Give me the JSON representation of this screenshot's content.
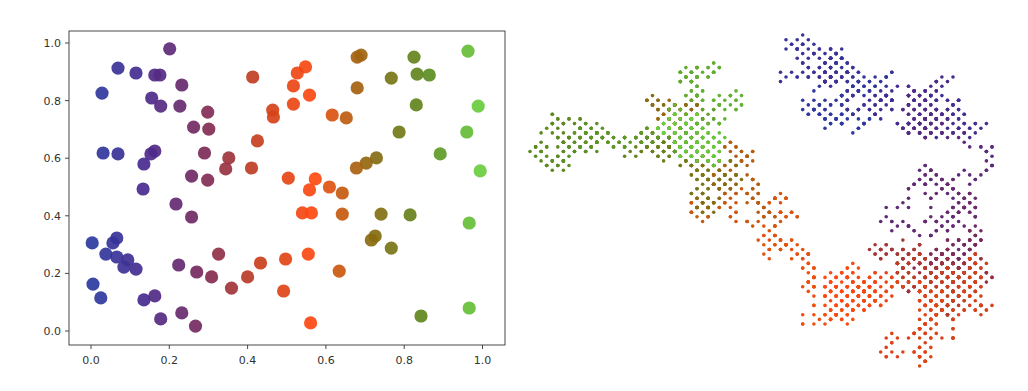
{
  "chart_data": [
    {
      "type": "scatter",
      "title": "",
      "xlabel": "",
      "ylabel": "",
      "xlim": [
        -0.05,
        1.05
      ],
      "ylim": [
        -0.05,
        1.04
      ],
      "grid": false,
      "legend": "none",
      "color_by": "x",
      "colormap": [
        "#2b3aa0",
        "#4a2a8e",
        "#7a2a5a",
        "#c7401c",
        "#ff4a10",
        "#8a6a10",
        "#5a8a20",
        "#6ad040"
      ],
      "xticks": [
        "0.0",
        "0.2",
        "0.4",
        "0.6",
        "0.8",
        "1.0"
      ],
      "yticks": [
        "0.0",
        "0.2",
        "0.4",
        "0.6",
        "0.8",
        "1.0"
      ],
      "points": [
        [
          0.201,
          0.98
        ],
        [
          0.069,
          0.913
        ],
        [
          0.115,
          0.896
        ],
        [
          0.163,
          0.889
        ],
        [
          0.176,
          0.889
        ],
        [
          0.232,
          0.854
        ],
        [
          0.028,
          0.826
        ],
        [
          0.155,
          0.809
        ],
        [
          0.178,
          0.781
        ],
        [
          0.227,
          0.781
        ],
        [
          0.298,
          0.76
        ],
        [
          0.262,
          0.708
        ],
        [
          0.301,
          0.701
        ],
        [
          0.031,
          0.618
        ],
        [
          0.069,
          0.615
        ],
        [
          0.163,
          0.625
        ],
        [
          0.153,
          0.615
        ],
        [
          0.29,
          0.618
        ],
        [
          0.135,
          0.58
        ],
        [
          0.257,
          0.538
        ],
        [
          0.298,
          0.524
        ],
        [
          0.133,
          0.493
        ],
        [
          0.217,
          0.441
        ],
        [
          0.257,
          0.396
        ],
        [
          0.003,
          0.306
        ],
        [
          0.066,
          0.323
        ],
        [
          0.056,
          0.306
        ],
        [
          0.038,
          0.267
        ],
        [
          0.066,
          0.257
        ],
        [
          0.094,
          0.247
        ],
        [
          0.084,
          0.222
        ],
        [
          0.115,
          0.215
        ],
        [
          0.224,
          0.229
        ],
        [
          0.27,
          0.205
        ],
        [
          0.308,
          0.188
        ],
        [
          0.326,
          0.267
        ],
        [
          0.005,
          0.163
        ],
        [
          0.025,
          0.115
        ],
        [
          0.135,
          0.108
        ],
        [
          0.163,
          0.122
        ],
        [
          0.178,
          0.042
        ],
        [
          0.232,
          0.063
        ],
        [
          0.267,
          0.017
        ],
        [
          0.413,
          0.882
        ],
        [
          0.548,
          0.917
        ],
        [
          0.527,
          0.896
        ],
        [
          0.517,
          0.851
        ],
        [
          0.558,
          0.819
        ],
        [
          0.517,
          0.788
        ],
        [
          0.464,
          0.767
        ],
        [
          0.466,
          0.743
        ],
        [
          0.616,
          0.75
        ],
        [
          0.652,
          0.74
        ],
        [
          0.68,
          0.951
        ],
        [
          0.68,
          0.844
        ],
        [
          0.425,
          0.66
        ],
        [
          0.352,
          0.601
        ],
        [
          0.344,
          0.563
        ],
        [
          0.41,
          0.566
        ],
        [
          0.504,
          0.531
        ],
        [
          0.573,
          0.528
        ],
        [
          0.558,
          0.49
        ],
        [
          0.609,
          0.5
        ],
        [
          0.642,
          0.479
        ],
        [
          0.54,
          0.41
        ],
        [
          0.563,
          0.41
        ],
        [
          0.642,
          0.406
        ],
        [
          0.433,
          0.236
        ],
        [
          0.497,
          0.25
        ],
        [
          0.555,
          0.267
        ],
        [
          0.4,
          0.188
        ],
        [
          0.359,
          0.149
        ],
        [
          0.492,
          0.139
        ],
        [
          0.634,
          0.208
        ],
        [
          0.561,
          0.028
        ],
        [
          0.69,
          0.958
        ],
        [
          0.825,
          0.951
        ],
        [
          0.963,
          0.972
        ],
        [
          0.767,
          0.878
        ],
        [
          0.833,
          0.892
        ],
        [
          0.864,
          0.889
        ],
        [
          0.831,
          0.785
        ],
        [
          0.989,
          0.781
        ],
        [
          0.787,
          0.691
        ],
        [
          0.96,
          0.691
        ],
        [
          0.892,
          0.615
        ],
        [
          0.994,
          0.556
        ],
        [
          0.729,
          0.601
        ],
        [
          0.703,
          0.583
        ],
        [
          0.678,
          0.566
        ],
        [
          0.741,
          0.406
        ],
        [
          0.815,
          0.403
        ],
        [
          0.966,
          0.375
        ],
        [
          0.726,
          0.33
        ],
        [
          0.716,
          0.316
        ],
        [
          0.767,
          0.288
        ],
        [
          0.843,
          0.052
        ],
        [
          0.966,
          0.08
        ]
      ]
    },
    {
      "type": "scatter",
      "title": "",
      "description": "2D random walk colored by step index",
      "axes_visible": false,
      "color_by": "step",
      "colormap": [
        "#2b3aa0",
        "#4a2a8e",
        "#7a2a5a",
        "#c7401c",
        "#ff4a10",
        "#8a6a10",
        "#5a8a20",
        "#6ad040"
      ],
      "steps": 6000,
      "seed": 7
    }
  ]
}
